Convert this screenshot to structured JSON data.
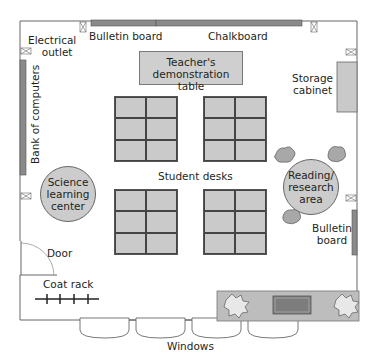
{
  "diagram": {
    "type": "classroom-floor-plan",
    "labels": {
      "electrical_outlet": [
        "Electrical",
        "outlet"
      ],
      "bulletin_board_top": "Bulletin board",
      "chalkboard": "Chalkboard",
      "teacher_table": [
        "Teacher's",
        "demonstration table"
      ],
      "storage_cabinet": [
        "Storage",
        "cabinet"
      ],
      "bank_of_computers": "Bank of computers",
      "student_desks": "Student desks",
      "science_center": [
        "Science",
        "learning",
        "center"
      ],
      "reading_area": [
        "Reading/",
        "research",
        "area"
      ],
      "bulletin_board_right": [
        "Bulletin",
        "board"
      ],
      "door": "Door",
      "coat_rack": "Coat rack",
      "windows": "Windows"
    },
    "desk_clusters": [
      {
        "id": "top-left",
        "rows": 3,
        "cols": 2
      },
      {
        "id": "top-right",
        "rows": 3,
        "cols": 2
      },
      {
        "id": "bottom-left",
        "rows": 3,
        "cols": 2
      },
      {
        "id": "bottom-right",
        "rows": 3,
        "cols": 2
      }
    ],
    "window_count": 4,
    "outlet_count": 5,
    "bean_bag_count": 3,
    "colors": {
      "wall": "#555555",
      "furniture_fill": "#c9c9c9",
      "board_fill": "#8a8a8a",
      "planter_fill": "#bdbdbd",
      "planter_inner": "#7d7d7d"
    }
  }
}
